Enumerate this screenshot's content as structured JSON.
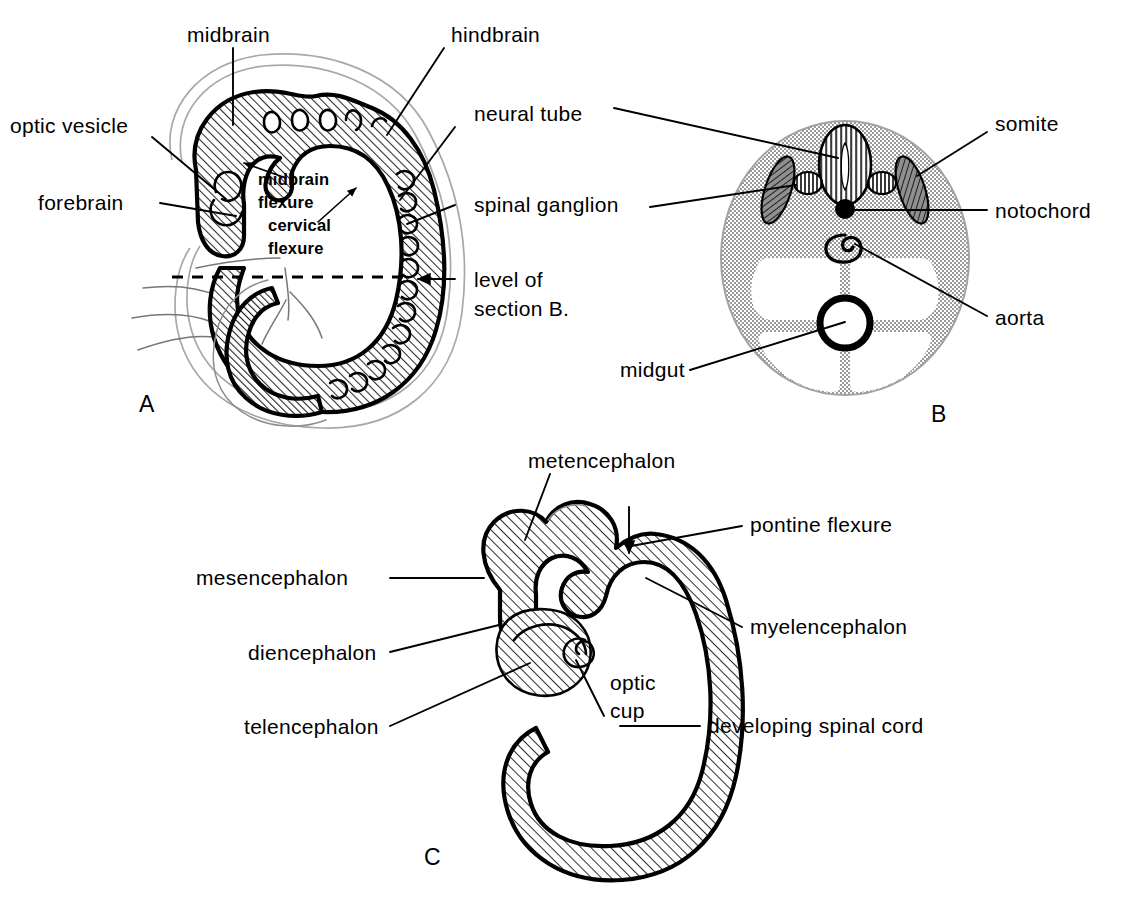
{
  "figure": {
    "background_color": "#ffffff",
    "ink_color": "#000000",
    "hatch_fill_color": "#d7d7d7",
    "stipple_fill_color": "#d0d0d0",
    "panel_letters": {
      "a": "A",
      "b": "B",
      "c": "C"
    }
  },
  "panel_a": {
    "letter": "A",
    "description": "Lateral view of whole embryo showing brain flexures, neural tube and spinal ganglia",
    "labels": {
      "midbrain": "midbrain",
      "hindbrain": "hindbrain",
      "optic_vesicle": "optic vesicle",
      "forebrain": "forebrain",
      "neural_tube": "neural tube",
      "spinal_ganglion": "spinal ganglion",
      "level_of_section_line1": "level of",
      "level_of_section_line2": "section B.",
      "midbrain_flexure_line1": "midbrain",
      "midbrain_flexure_line2": "flexure",
      "cervical_flexure_line1": "cervical",
      "cervical_flexure_line2": "flexure"
    }
  },
  "panel_b": {
    "letter": "B",
    "description": "Transverse section of the embryo at the level indicated in A",
    "labels": {
      "neural_tube": "neural tube",
      "somite": "somite",
      "notochord": "notochord",
      "spinal_ganglion": "spinal ganglion",
      "aorta": "aorta",
      "midgut": "midgut"
    }
  },
  "panel_c": {
    "letter": "C",
    "description": "Enlarged view of the developing brain vesicles and spinal cord",
    "labels": {
      "metencephalon": "metencephalon",
      "pontine_flexure": "pontine flexure",
      "mesencephalon": "mesencephalon",
      "myelencephalon": "myelencephalon",
      "diencephalon": "diencephalon",
      "telencephalon": "telencephalon",
      "optic_cup_line1": "optic",
      "optic_cup_line2": "cup",
      "developing_spinal_cord": "developing spinal cord"
    }
  }
}
